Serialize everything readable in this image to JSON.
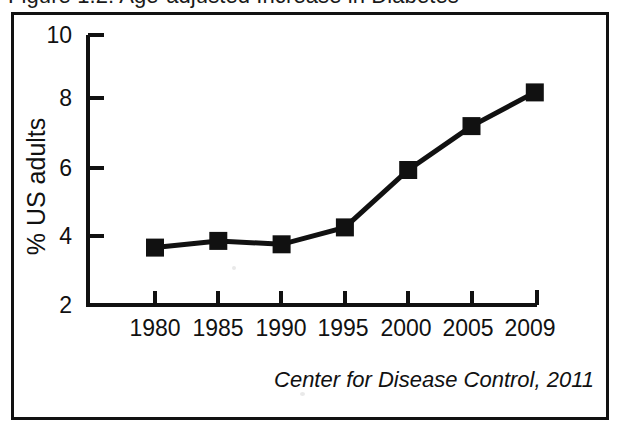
{
  "figure": {
    "title": "Figure 1.2: Age-adjusted Increase in Diabetes",
    "source_caption": "Center for Disease Control, 2011"
  },
  "chart_data": {
    "type": "line",
    "title": "Figure 1.2: Age-adjusted Increase in Diabetes",
    "xlabel": "",
    "ylabel": "% US adults",
    "categories": [
      "1980",
      "1985",
      "1990",
      "1995",
      "2000",
      "2005",
      "2009"
    ],
    "values": [
      3.7,
      3.9,
      3.8,
      4.3,
      6.0,
      7.3,
      8.3
    ],
    "series": [
      {
        "name": "% US adults with diagnosed diabetes",
        "values": [
          3.7,
          3.9,
          3.8,
          4.3,
          6.0,
          7.3,
          8.3
        ]
      }
    ],
    "ylim": [
      2,
      10
    ],
    "y_ticks": [
      2,
      4,
      6,
      8,
      10
    ],
    "y_tick_labels": [
      "2",
      "4",
      "6",
      "8",
      "10"
    ],
    "x_tick_labels": [
      "1980",
      "1985",
      "1990",
      "1995",
      "2000",
      "2005",
      "2009"
    ],
    "grid": false,
    "legend": false,
    "marker": "filled-square",
    "line_color": "#111111",
    "marker_color": "#111111",
    "annotations": [
      "Center for Disease Control, 2011"
    ]
  },
  "axis": {
    "y_labels": [
      "10",
      "8",
      "6",
      "4",
      "2"
    ],
    "x_labels": [
      "1980",
      "1985",
      "1990",
      "1995",
      "2000",
      "2005",
      "2009"
    ],
    "y_title": "% US adults"
  }
}
